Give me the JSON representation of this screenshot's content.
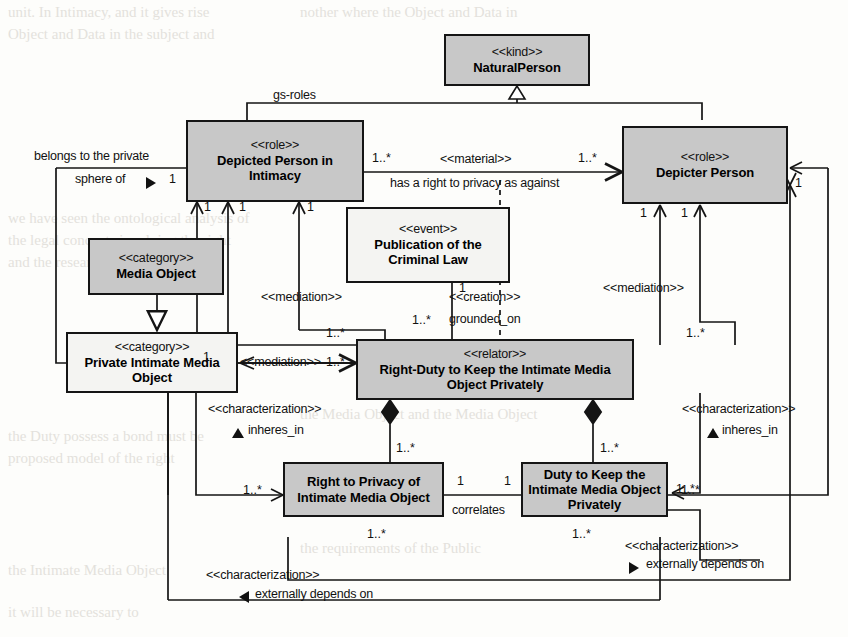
{
  "diagram": {
    "type": "uml-class-diagram",
    "colors": {
      "node_fill_gray": "#c8c8c8",
      "node_fill_white": "#f4f4f2",
      "stroke": "#151515",
      "background": "#fdfdfb"
    }
  },
  "nodes": [
    {
      "id": "natural_person",
      "stereotype": "<<kind>>",
      "name": "NaturalPerson",
      "fill": "gray"
    },
    {
      "id": "depicted_person",
      "stereotype": "<<role>>",
      "name": "Depicted Person in Intimacy",
      "fill": "gray"
    },
    {
      "id": "depicter_person",
      "stereotype": "<<role>>",
      "name": "Depicter Person",
      "fill": "gray"
    },
    {
      "id": "publication",
      "stereotype": "<<event>>",
      "name": "Publication of the Criminal Law",
      "fill": "white"
    },
    {
      "id": "media_object",
      "stereotype": "<<category>>",
      "name": "Media Object",
      "fill": "gray"
    },
    {
      "id": "private_media",
      "stereotype": "<<category>>",
      "name": "Private Intimate Media Object",
      "fill": "white"
    },
    {
      "id": "right_duty",
      "stereotype": "<<relator>>",
      "name": "Right-Duty to Keep the Intimate Media Object Privately",
      "fill": "gray"
    },
    {
      "id": "right_privacy",
      "stereotype": "",
      "name": "Right to Privacy of Intimate Media Object",
      "fill": "gray"
    },
    {
      "id": "duty_keep",
      "stereotype": "",
      "name": "Duty to Keep the Intimate Media Object Privately",
      "fill": "gray"
    }
  ],
  "labels": {
    "gs_roles": "gs-roles",
    "belongs_line1": "belongs to the private",
    "belongs_line2": "sphere of",
    "material_stereo": "<<material>>",
    "material_name": "has a right to privacy as against",
    "mediation_left_upper": "<<mediation>>",
    "mediation_left_lower": "<<mediation>>",
    "mediation_right": "<<mediation>>",
    "creation_stereo": "<<creation>>",
    "creation_name": "grounded_on",
    "charact_left_stereo": "<<characterization>>",
    "charact_left_name": "inheres_in",
    "charact_right_stereo": "<<characterization>>",
    "charact_right_name": "inheres_in",
    "correlates": "correlates",
    "charact_bottom_left_stereo": "<<characterization>>",
    "charact_bottom_left_name": "externally depends on",
    "charact_bottom_right_stereo": "<<characterization>>",
    "charact_bottom_right_name": "externally depends on"
  },
  "multiplicities": {
    "belongs_sphere_of": "1",
    "material_source": "1..*",
    "material_target": "1..*",
    "depicted_med_a": "1",
    "depicted_med_b": "1",
    "depicted_med_c": "1",
    "depicter_med_a": "1",
    "depicter_med_b": "1",
    "depicter_med_c": "1",
    "publication_creation": "1",
    "creation_multi": "1..*",
    "mediation_left_upper_multi": "1..*",
    "mediation_left_lower_multi": "1..*",
    "mediation_right_multi": "1..*",
    "private_media_mediation": "1",
    "inheres_left_multi": "1..*",
    "inheres_right_multi": "1..*",
    "right_top_multi": "1..*",
    "duty_top_multi": "1..*",
    "correlates_left": "1",
    "correlates_right": "1",
    "duty_right_multi": "1..*",
    "right_bottom_multi": "1..*",
    "duty_bottom_multi": "1..*"
  },
  "background_text": [
    {
      "t": "unit. In Intimacy, and it gives rise",
      "x": 8,
      "y": 4
    },
    {
      "t": "nother where the Object and Data in",
      "x": 300,
      "y": 4
    },
    {
      "t": "Object and Data in the subject and",
      "x": 8,
      "y": 26
    },
    {
      "t": "we have seen the ontological analysis of",
      "x": 8,
      "y": 210
    },
    {
      "t": "the legal concepts involving the right",
      "x": 8,
      "y": 232
    },
    {
      "t": "and the research on the relations",
      "x": 8,
      "y": 254
    },
    {
      "t": "the Media Object and the Media Object",
      "x": 300,
      "y": 406
    },
    {
      "t": "the Duty possess a bond must be",
      "x": 8,
      "y": 428
    },
    {
      "t": "proposed model of the right",
      "x": 8,
      "y": 450
    },
    {
      "t": "the requirements of the Public",
      "x": 300,
      "y": 540
    },
    {
      "t": "the Intimate Media Object",
      "x": 8,
      "y": 562
    },
    {
      "t": "it will be necessary to",
      "x": 8,
      "y": 604
    }
  ]
}
